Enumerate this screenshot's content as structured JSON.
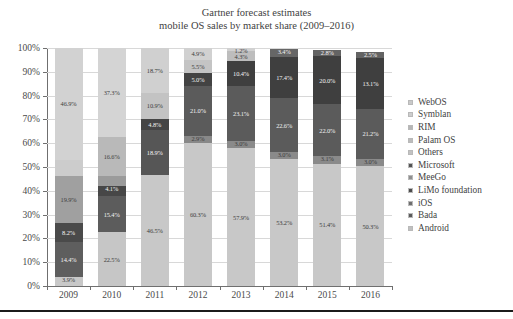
{
  "chart": {
    "title_line1": "Gartner forecast estimates",
    "title_line2": "mobile OS sales by market share (2009–2016)"
  },
  "axis": {
    "y_ticks": [
      "0%",
      "10%",
      "20%",
      "30%",
      "40%",
      "50%",
      "60%",
      "70%",
      "80%",
      "90%",
      "100%"
    ],
    "x_ticks": [
      "2009",
      "2010",
      "2011",
      "2012",
      "2013",
      "2014",
      "2015",
      "2016"
    ]
  },
  "legend": {
    "items": [
      {
        "label": "WebOS",
        "color": "#c9c9c9"
      },
      {
        "label": "Symblan",
        "color": "#cdcdcd"
      },
      {
        "label": "RIM",
        "color": "#b6b6b6"
      },
      {
        "label": "Palam OS",
        "color": "#bcbcbc"
      },
      {
        "label": "Others",
        "color": "#c2c2c2"
      },
      {
        "label": "Microsoft",
        "color": "#535353"
      },
      {
        "label": "MeeGo",
        "color": "#8f8f8f"
      },
      {
        "label": "LiMo foundation",
        "color": "#4c4c4c"
      },
      {
        "label": "iOS",
        "color": "#6e6e6e"
      },
      {
        "label": "Bada",
        "color": "#5a5a5a"
      },
      {
        "label": "Android",
        "color": "#c0c0c0"
      }
    ]
  },
  "chart_data": {
    "type": "bar",
    "subtype": "stacked-100-percent",
    "title": "Gartner forecast estimates mobile OS sales by market share (2009–2016)",
    "xlabel": "",
    "ylabel": "",
    "ylim": [
      0,
      100
    ],
    "grid": true,
    "legend_position": "right",
    "categories": [
      "2009",
      "2010",
      "2011",
      "2012",
      "2013",
      "2014",
      "2015",
      "2016"
    ],
    "series": [
      {
        "name": "Android",
        "color": "#c0c0c0",
        "values": [
          3.9,
          22.5,
          46.5,
          60.3,
          57.9,
          53.2,
          51.4,
          50.3
        ]
      },
      {
        "name": "Bada",
        "color": "#5a5a5a",
        "values": [
          14.4,
          15.4,
          18.9,
          21.0,
          23.1,
          22.6,
          22.0,
          21.2
        ]
      },
      {
        "name": "iOS",
        "color": "#6e6e6e",
        "values": [
          8.2,
          15.4,
          4.8,
          2.9,
          3.0,
          3.0,
          3.1,
          3.0
        ]
      },
      {
        "name": "Microsoft",
        "color": "#535353",
        "values": [
          19.9,
          4.1,
          10.9,
          21.0,
          19.5,
          17.4,
          20.0,
          13.1
        ]
      },
      {
        "name": "Others",
        "color": "#c2c2c2",
        "values": [
          46.9,
          16.6,
          18.7,
          5.5,
          4.9,
          3.4,
          2.8,
          2.5
        ]
      },
      {
        "name": "RIM",
        "color": "#b6b6b6",
        "values": [
          0,
          37.3,
          0,
          4.9,
          1.2,
          0,
          0,
          0
        ]
      }
    ],
    "bars": [
      {
        "year": "2009",
        "segments": [
          {
            "name": "Android",
            "value": 3.9,
            "label": "3.9%",
            "color": "#c8c8c8",
            "label_color": "dark"
          },
          {
            "name": "Bada",
            "value": 14.4,
            "label": "14.4%",
            "color": "#5e5e5e",
            "label_color": "light"
          },
          {
            "name": "iOS",
            "value": 8.2,
            "label": "8.2%",
            "color": "#4a4a4a",
            "label_color": "light"
          },
          {
            "name": "Microsoft",
            "value": 19.9,
            "label": "19.9%",
            "color": "#a0a0a0",
            "label_color": "dark"
          },
          {
            "name": "Others",
            "value": 6.7,
            "label": "",
            "color": "#cccccc",
            "label_color": "dark"
          },
          {
            "name": "Symblan",
            "value": 46.9,
            "label": "46.9%",
            "color": "#d2d2d2",
            "label_color": "dark"
          }
        ]
      },
      {
        "year": "2010",
        "segments": [
          {
            "name": "Android",
            "value": 22.5,
            "label": "22.5%",
            "color": "#c6c6c6",
            "label_color": "dark"
          },
          {
            "name": "Bada",
            "value": 15.4,
            "label": "15.4%",
            "color": "#5c5c5c",
            "label_color": "light"
          },
          {
            "name": "iOS",
            "value": 4.1,
            "label": "4.1%",
            "color": "#474747",
            "label_color": "light"
          },
          {
            "name": "Microsoft",
            "value": 4.2,
            "label": "",
            "color": "#9b9b9b",
            "label_color": "dark"
          },
          {
            "name": "Others",
            "value": 16.6,
            "label": "16.6%",
            "color": "#b9b9b9",
            "label_color": "dark"
          },
          {
            "name": "Symblan",
            "value": 37.2,
            "label": "37.3%",
            "color": "#d4d4d4",
            "label_color": "dark"
          }
        ]
      },
      {
        "year": "2011",
        "segments": [
          {
            "name": "Android",
            "value": 46.5,
            "label": "46.5%",
            "color": "#c8c8c8",
            "label_color": "dark"
          },
          {
            "name": "Bada",
            "value": 18.9,
            "label": "18.9%",
            "color": "#565656",
            "label_color": "light"
          },
          {
            "name": "iOS",
            "value": 4.8,
            "label": "4.8%",
            "color": "#454545",
            "label_color": "light"
          },
          {
            "name": "Microsoft",
            "value": 10.9,
            "label": "10.9%",
            "color": "#c3c3c3",
            "label_color": "dark"
          },
          {
            "name": "Others",
            "value": 18.9,
            "label": "18.7%",
            "color": "#d0d0d0",
            "label_color": "dark"
          }
        ]
      },
      {
        "year": "2012",
        "segments": [
          {
            "name": "Android",
            "value": 60.3,
            "label": "60.3%",
            "color": "#c8c8c8",
            "label_color": "dark"
          },
          {
            "name": "Bada",
            "value": 2.9,
            "label": "2.9%",
            "color": "#888888",
            "label_color": "dark"
          },
          {
            "name": "iOS",
            "value": 21.0,
            "label": "21.0%",
            "color": "#5b5b5b",
            "label_color": "light"
          },
          {
            "name": "Microsoft",
            "value": 5.4,
            "label": "5.0%",
            "color": "#434343",
            "label_color": "light"
          },
          {
            "name": "Others",
            "value": 5.5,
            "label": "5.5%",
            "color": "#c4c4c4",
            "label_color": "dark"
          },
          {
            "name": "RIM",
            "value": 4.9,
            "label": "4.9%",
            "color": "#d1d1d1",
            "label_color": "dark"
          }
        ]
      },
      {
        "year": "2013",
        "segments": [
          {
            "name": "Android",
            "value": 57.9,
            "label": "57.9%",
            "color": "#c8c8c8",
            "label_color": "dark"
          },
          {
            "name": "Bada",
            "value": 3.0,
            "label": "3.0%",
            "color": "#8a8a8a",
            "label_color": "dark"
          },
          {
            "name": "iOS",
            "value": 23.1,
            "label": "23.1%",
            "color": "#5b5b5b",
            "label_color": "light"
          },
          {
            "name": "Microsoft",
            "value": 10.5,
            "label": "10.4%",
            "color": "#3f3f3f",
            "label_color": "light"
          },
          {
            "name": "Others",
            "value": 4.3,
            "label": "4.3%",
            "color": "#bdbdbd",
            "label_color": "dark"
          },
          {
            "name": "RIM",
            "value": 1.2,
            "label": "1.2%",
            "color": "#d1d1d1",
            "label_color": "dark"
          }
        ]
      },
      {
        "year": "2014",
        "segments": [
          {
            "name": "Android",
            "value": 53.2,
            "label": "53.2%",
            "color": "#c8c8c8",
            "label_color": "dark"
          },
          {
            "name": "Bada",
            "value": 3.0,
            "label": "3.0%",
            "color": "#8a8a8a",
            "label_color": "dark"
          },
          {
            "name": "iOS",
            "value": 22.6,
            "label": "22.6%",
            "color": "#5b5b5b",
            "label_color": "light"
          },
          {
            "name": "Microsoft",
            "value": 17.4,
            "label": "17.4%",
            "color": "#3f3f3f",
            "label_color": "light"
          },
          {
            "name": "Others",
            "value": 3.4,
            "label": "3.4%",
            "color": "#666666",
            "label_color": "light"
          }
        ]
      },
      {
        "year": "2015",
        "segments": [
          {
            "name": "Android",
            "value": 51.4,
            "label": "51.4%",
            "color": "#c8c8c8",
            "label_color": "dark"
          },
          {
            "name": "Bada",
            "value": 3.1,
            "label": "3.1%",
            "color": "#8a8a8a",
            "label_color": "dark"
          },
          {
            "name": "iOS",
            "value": 22.0,
            "label": "22.0%",
            "color": "#5b5b5b",
            "label_color": "light"
          },
          {
            "name": "Microsoft",
            "value": 20.0,
            "label": "20.0%",
            "color": "#3f3f3f",
            "label_color": "light"
          },
          {
            "name": "Others",
            "value": 2.8,
            "label": "2.8%",
            "color": "#636363",
            "label_color": "light"
          }
        ]
      },
      {
        "year": "2016",
        "segments": [
          {
            "name": "Android",
            "value": 50.3,
            "label": "50.3%",
            "color": "#c8c8c8",
            "label_color": "dark"
          },
          {
            "name": "Bada",
            "value": 3.0,
            "label": "3.0%",
            "color": "#8a8a8a",
            "label_color": "dark"
          },
          {
            "name": "iOS",
            "value": 21.2,
            "label": "21.2%",
            "color": "#5b5b5b",
            "label_color": "light"
          },
          {
            "name": "Microsoft",
            "value": 21.3,
            "label": "13.1%",
            "color": "#3f3f3f",
            "label_color": "light"
          },
          {
            "name": "Others",
            "value": 2.5,
            "label": "2.5%",
            "color": "#636363",
            "label_color": "light"
          }
        ]
      }
    ]
  }
}
